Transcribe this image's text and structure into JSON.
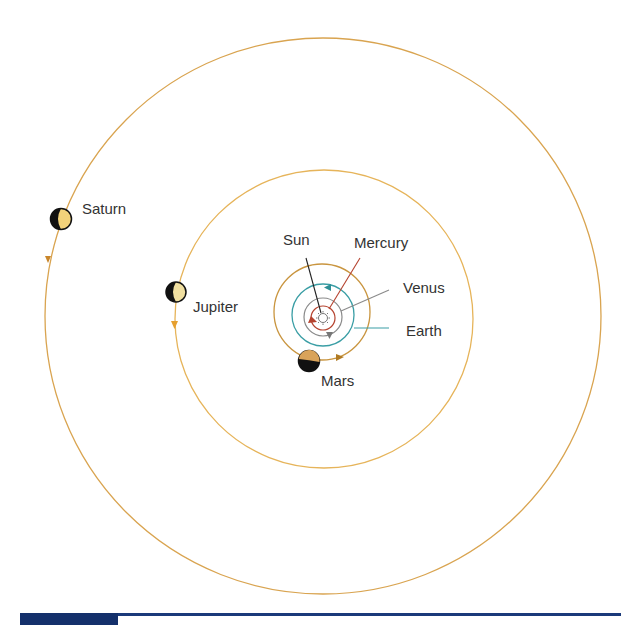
{
  "diagram": {
    "title": "",
    "bodies": [
      {
        "id": "sun",
        "label": "Sun",
        "type": "star",
        "color": "#333333"
      },
      {
        "id": "mercury",
        "label": "Mercury",
        "type": "planet",
        "orbit_color": "#b5432f"
      },
      {
        "id": "venus",
        "label": "Venus",
        "type": "planet",
        "orbit_color": "#8a8a8a"
      },
      {
        "id": "earth",
        "label": "Earth",
        "type": "planet",
        "orbit_color": "#3a9ea5"
      },
      {
        "id": "mars",
        "label": "Mars",
        "type": "planet",
        "orbit_color": "#c9953f",
        "body_color": "#d9a35a"
      },
      {
        "id": "jupiter",
        "label": "Jupiter",
        "type": "planet",
        "orbit_color": "#e6b45a",
        "body_color": "#f0dfa0"
      },
      {
        "id": "saturn",
        "label": "Saturn",
        "type": "planet",
        "orbit_color": "#d9a450",
        "body_color": "#f2d27a"
      }
    ],
    "colors": {
      "label_text": "#333333",
      "leader_sun": "#222222",
      "leader_mercury": "#b5432f",
      "leader_venus": "#8a8a8a",
      "leader_earth": "#3a9ea5",
      "planet_dark_side": "#111111",
      "footer_bar": "#1b3a7a"
    }
  }
}
